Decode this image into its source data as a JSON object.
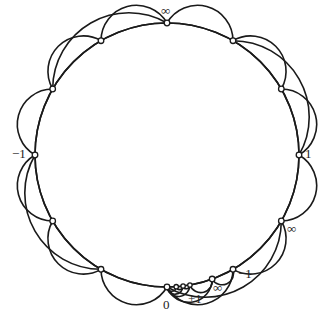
{
  "diagram": {
    "type": "farey-tessellation-poincare-disk",
    "stroke_color": "#1a1a1a",
    "background": "#ffffff",
    "center": [
      167,
      155
    ],
    "radius": 132,
    "vertices_deg": [
      90,
      120,
      150,
      180,
      210,
      240,
      270,
      274,
      277,
      280,
      290,
      300,
      330,
      0,
      30,
      60
    ],
    "geodesics": [
      [
        90,
        180
      ],
      [
        180,
        270
      ],
      [
        270,
        0
      ],
      [
        0,
        90
      ],
      [
        90,
        150
      ],
      [
        150,
        180
      ],
      [
        90,
        120
      ],
      [
        120,
        150
      ],
      [
        180,
        240
      ],
      [
        240,
        270
      ],
      [
        180,
        210
      ],
      [
        210,
        240
      ],
      [
        0,
        60
      ],
      [
        60,
        90
      ],
      [
        0,
        30
      ],
      [
        30,
        60
      ],
      [
        270,
        330
      ],
      [
        330,
        0
      ],
      [
        300,
        330
      ],
      [
        270,
        300
      ],
      [
        270,
        290
      ],
      [
        290,
        300
      ],
      [
        270,
        280
      ],
      [
        280,
        290
      ],
      [
        270,
        277
      ],
      [
        277,
        280
      ],
      [
        270,
        274
      ],
      [
        274,
        277
      ]
    ],
    "labels": [
      {
        "id": "top-inf",
        "text": "∞",
        "x": 161,
        "y": 4
      },
      {
        "id": "left-neg1",
        "text": "−1",
        "x": 12,
        "y": 147
      },
      {
        "id": "right-1",
        "text": "1",
        "x": 305,
        "y": 147
      },
      {
        "id": "bottom-0",
        "text": "0",
        "x": 163,
        "y": 298
      },
      {
        "id": "bottom-plus1",
        "text": "+1",
        "x": 188,
        "y": 292
      },
      {
        "id": "bottom-inf",
        "text": "∞",
        "x": 213,
        "y": 281
      },
      {
        "id": "bottom-neg1",
        "text": "−1",
        "x": 238,
        "y": 267
      },
      {
        "id": "right-inf",
        "text": "∞",
        "x": 287,
        "y": 222
      }
    ]
  }
}
